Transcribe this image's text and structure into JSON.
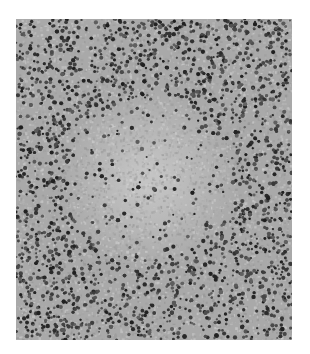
{
  "image": {
    "kind": "grayscale histology micrograph",
    "description": "Dense field of small dark round cell nuclei with a paler central region of larger, lighter cells",
    "background_color": "#ffffff",
    "tissue_base_color": "#a9a9a9",
    "nucleus_color": "#3a3a3a",
    "pale_region_color": "#c4c4c4",
    "frame": {
      "x": 16,
      "y": 19,
      "width": 276,
      "height": 321
    }
  }
}
